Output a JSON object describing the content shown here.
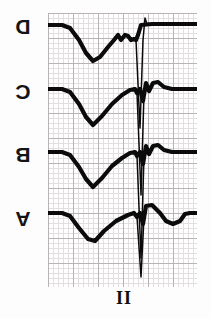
{
  "figure": {
    "type": "ecg-strip",
    "orientation": "rotated-180",
    "lead_label": "II",
    "panels": [
      {
        "id": "A",
        "label": "A"
      },
      {
        "id": "B",
        "label": "B"
      },
      {
        "id": "C",
        "label": "C"
      },
      {
        "id": "D",
        "label": "D"
      }
    ],
    "colors": {
      "trace": "#0b0b0b",
      "grid_minor": "#e3dfe0",
      "grid_major": "#b9b3b4",
      "background": "#ffffff",
      "text": "#141414"
    },
    "grid": {
      "minor_px": 5,
      "major_px": 25,
      "left": 48,
      "top": 13,
      "width": 149,
      "height": 274
    }
  },
  "chart_data": {
    "type": "line",
    "title": "",
    "subtitle": "",
    "xlabel": "II",
    "ylabel": "",
    "legend": [
      "A",
      "B",
      "C",
      "D"
    ],
    "legend_position": "left-of-axes",
    "grid": "on",
    "note": "Four stacked electrocardiogram lead II complexes, printed upside down. Each panel shows a broad inverted deflection (T wave), a narrow tall spike (QRS complex) and a terminal notch. Coordinates are in grid-pixel space: x from 0 to 149, y from 0 to 274 measured downward from the top of the grid.",
    "series": [
      {
        "name": "D",
        "baseline_y": 12,
        "body": "M 0,12 L 14,12 L 22,15 L 31,27 L 38,40 L 45,48 L 52,44 L 60,34 L 66,27 L 70,22 L 73,27 L 77,22 L 80,23 L 83,27 L 86,26 L 88,27 L 90,22 L 93,12 L 104,11 L 149,11",
        "spike": "M 88,27 L 92,115 L 95,27 L 97,5 L 99,11",
        "features": {
          "t_wave_trough_y": 48,
          "qrs_peak_y": 115,
          "terminal_notch": true
        }
      },
      {
        "name": "C",
        "baseline_y": 76,
        "body": "M 0,76 L 14,76 L 22,79 L 31,91 L 38,104 L 45,112 L 54,103 L 64,91 L 74,82 L 82,77 L 87,76 L 89,80 L 92,76 L 95,88 L 98,70 L 101,78 L 105,70 L 110,69 L 116,74 L 124,76 L 149,76",
        "spike": "M 89,80 L 93,182 L 96,80",
        "features": {
          "t_wave_trough_y": 112,
          "qrs_peak_y": 182,
          "terminal_notch": true
        }
      },
      {
        "name": "B",
        "baseline_y": 139,
        "body": "M 0,139 L 14,139 L 22,142 L 31,154 L 38,166 L 45,174 L 54,165 L 64,153 L 74,145 L 82,140 L 87,139 L 89,143 L 92,139 L 95,151 L 98,133 L 101,141 L 105,133 L 110,132 L 116,137 L 124,139 L 149,139",
        "spike": "M 89,143 L 93,245 L 96,143",
        "features": {
          "t_wave_trough_y": 174,
          "qrs_peak_y": 245,
          "terminal_notch": true
        }
      },
      {
        "name": "A",
        "baseline_y": 200,
        "body": "M 0,200 L 14,200 L 22,203 L 31,215 L 40,226 L 47,228 L 56,218 L 68,208 L 80,202 L 86,200 L 89,204 L 92,200 L 95,211 L 98,193 L 104,192 L 112,200 L 118,208 L 125,211 L 132,208 L 137,201 L 142,200 L 149,200",
        "spike": "M 89,204 L 93,264 L 96,204",
        "features": {
          "t_wave_trough_y": 228,
          "qrs_peak_y": 264,
          "terminal_notch": true,
          "secondary_dip_y": 211
        }
      }
    ],
    "x_axis": {
      "range": [
        0,
        149
      ],
      "ticks": [],
      "ticklabels": []
    },
    "y_axis": {
      "range": [
        274,
        0
      ],
      "ticks": [],
      "ticklabels": []
    }
  }
}
